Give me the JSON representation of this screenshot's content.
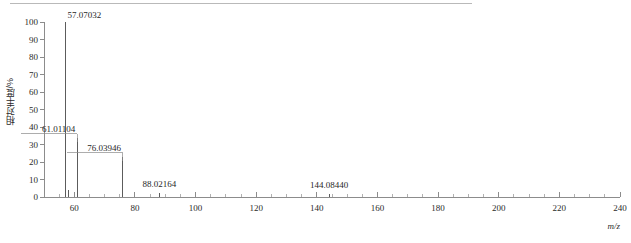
{
  "figure": {
    "top_rule": true
  },
  "chart_data": {
    "type": "bar",
    "title": "",
    "subtitle": "",
    "xlabel": "m/z",
    "ylabel": "相对丰度/%",
    "xlim": [
      50,
      240
    ],
    "ylim": [
      0,
      100
    ],
    "x_major_ticks": [
      60,
      80,
      100,
      120,
      140,
      160,
      180,
      200,
      220,
      240
    ],
    "x_major_tick_labels": [
      "60",
      "80",
      "100",
      "120",
      "140",
      "160",
      "180",
      "200",
      "220",
      "240"
    ],
    "x_minor_tick_step": 5,
    "y_ticks": [
      0,
      10,
      20,
      30,
      40,
      50,
      60,
      70,
      80,
      90,
      100
    ],
    "y_tick_labels": [
      "0",
      "10",
      "20",
      "30",
      "40",
      "50",
      "60",
      "70",
      "80",
      "90",
      "100"
    ],
    "grid": false,
    "legend": null,
    "x": [
      57.07032,
      58.06,
      61.01104,
      76.03946,
      88.02164,
      144.0844
    ],
    "values": [
      100,
      4.2,
      34,
      23,
      2.2,
      1.6
    ],
    "labeled_peaks": [
      {
        "mz": "57.07032",
        "intensity": 100,
        "label_anchor": "start",
        "label_dx": 2,
        "label_dy": -4,
        "leader": false
      },
      {
        "mz": "61.01104",
        "intensity": 34,
        "label_anchor": "end",
        "label_dx": -2,
        "label_dy": -6,
        "leader": true
      },
      {
        "mz": "76.03946",
        "intensity": 23,
        "label_anchor": "end",
        "label_dx": -2,
        "label_dy": -6,
        "leader": true
      },
      {
        "mz": "88.02164",
        "intensity": 2.2,
        "label_anchor": "middle",
        "label_dx": 0,
        "label_dy": -6,
        "leader": false
      },
      {
        "mz": "144.08440",
        "intensity": 1.6,
        "label_anchor": "middle",
        "label_dx": 0,
        "label_dy": -6,
        "leader": false
      }
    ],
    "unlabeled_peaks": [
      {
        "mz": "58.06",
        "intensity": 4.2
      }
    ]
  },
  "colors": {
    "axis": "#6f6f6f",
    "peak": "#4a4a4a",
    "text": "#1f1f1f",
    "rule": "#b9b9b9",
    "background": "#ffffff"
  }
}
